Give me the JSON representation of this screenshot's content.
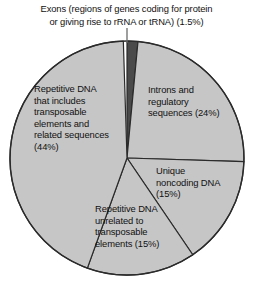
{
  "chart_data": {
    "type": "pie",
    "title": "",
    "legend_position": "labels-on-slices",
    "units": "percent of human genome",
    "total": 99.5,
    "categories": [
      "Exons (regions of genes coding for protein or giving rise to rRNA or tRNA)",
      "Introns and regulatory sequences",
      "Unique noncoding DNA",
      "Repetitive DNA unrelated to transposable elements",
      "Repetitive DNA that includes transposable elements and related sequences"
    ],
    "values": [
      1.5,
      24,
      15,
      15,
      44
    ],
    "slices": [
      {
        "key": "exons",
        "label": "Exons (regions of genes coding for protein or giving rise to rRNA or tRNA) (1.5%)",
        "value": 1.5,
        "percent_text": "(1.5%)",
        "start_angle_deg": 0,
        "end_angle_deg": 5.4,
        "fill": "#4a4a4a",
        "label_placement": "callout-above",
        "has_leader_line": true
      },
      {
        "key": "introns",
        "label": "Introns and regulatory sequences (24%)",
        "value": 24,
        "percent_text": "(24%)",
        "start_angle_deg": 5.4,
        "end_angle_deg": 91.8,
        "fill": "#c6c6c6",
        "label_placement": "inside"
      },
      {
        "key": "unique-noncoding",
        "label": "Unique noncoding DNA (15%)",
        "value": 15,
        "percent_text": "(15%)",
        "start_angle_deg": 91.8,
        "end_angle_deg": 145.8,
        "fill": "#c6c6c6",
        "label_placement": "inside"
      },
      {
        "key": "repetitive-unrelated",
        "label": "Repetitive DNA unrelated to transposable elements (15%)",
        "value": 15,
        "percent_text": "(15%)",
        "start_angle_deg": 145.8,
        "end_angle_deg": 199.8,
        "fill": "#c6c6c6",
        "label_placement": "inside"
      },
      {
        "key": "repetitive-transposable",
        "label": "Repetitive DNA that includes transposable elements and related sequences (44%)",
        "value": 44,
        "percent_text": "(44%)",
        "start_angle_deg": 199.8,
        "end_angle_deg": 358.2,
        "fill": "#c6c6c6",
        "label_placement": "inside"
      }
    ],
    "geometry": {
      "center_x": 127,
      "center_y": 158,
      "radius": 117
    },
    "colors": {
      "slice_fill": "#c6c6c6",
      "exon_fill": "#4a4a4a",
      "outline": "#2b2b2b",
      "leader_line": "#6b6b6b",
      "background": "#ffffff",
      "text": "#111111"
    }
  },
  "caption": {
    "exons_text": "Exons (regions of genes coding for protein or giving rise to rRNA or tRNA) (1.5%)",
    "exons_line_1": "Exons (regions of genes coding for protein",
    "exons_line_2": "or giving rise to rRNA or tRNA) (1.5%)"
  },
  "labels": {
    "introns": "Introns and regulatory sequences (24%)",
    "repetitive_transposable": "Repetitive DNA that includes transposable elements and related sequences (44%)",
    "unique_noncoding": "Unique noncoding DNA (15%)",
    "repetitive_unrelated": "Repetitive DNA unrelated to transposable elements (15%)"
  }
}
